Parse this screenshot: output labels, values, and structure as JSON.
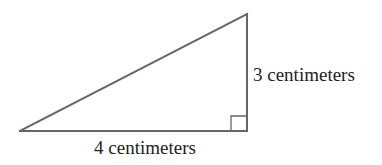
{
  "figure": {
    "shape": "right-triangle",
    "right_angle_vertex": "bottom-right",
    "sides": {
      "vertical_leg": {
        "length": 3,
        "unit": "centimeters",
        "label": "3 centimeters"
      },
      "horizontal_leg": {
        "length": 4,
        "unit": "centimeters",
        "label": "4 centimeters"
      },
      "hypotenuse": {
        "label": ""
      }
    },
    "colors": {
      "stroke": "#666666",
      "text": "#222222",
      "background": "#ffffff"
    }
  }
}
